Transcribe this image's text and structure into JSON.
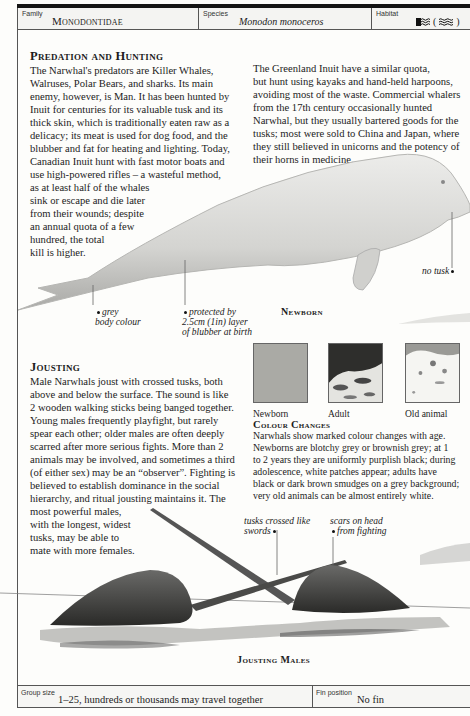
{
  "header": {
    "family_label": "Family",
    "family_value": "Monodontidae",
    "species_label": "Species",
    "species_value": "Monodon monoceros",
    "habitat_label": "Habitat",
    "habitat_icons": [
      "sea-ice-icon",
      "open-sea-icon"
    ],
    "habitat_paren_open": "(",
    "habitat_paren_close": ")"
  },
  "predation": {
    "title": "Predation and Hunting",
    "lines": [
      "The Narwhal's predators are Killer Whales,",
      "Walruses, Polar Bears, and sharks. Its main",
      "enemy, however, is Man. It has been hunted by",
      "Inuit for centuries for its valuable tusk and its",
      "thick skin, which is traditionally eaten raw as a",
      "delicacy; its meat is used for dog food, and the",
      "blubber and fat for heating and lighting. Today,",
      "Canadian Inuit hunt with fast motor boats and",
      "use high-powered rifles – a wasteful method,",
      "as at least half of the whales",
      "sink or escape and die later",
      "from their wounds; despite",
      "an annual quota of a few",
      "hundred, the total",
      "kill is higher."
    ]
  },
  "greenland": {
    "lines": [
      "The Greenland Inuit have a similar quota,",
      "but hunt using kayaks and hand-held harpoons,",
      "avoiding most of the waste. Commercial whalers",
      "from the 17th century occasionally hunted",
      "Narwhal, but they usually bartered goods for the",
      "tusks; most were sold to China and Japan, where",
      "they still believed in unicorns and the potency of",
      "their horns in medicine."
    ]
  },
  "newborn": {
    "title": "Newborn",
    "captions": {
      "grey": [
        "grey",
        "body colour"
      ],
      "blubber": [
        "protected by",
        "2.5cm (1in) layer",
        "of blubber at birth"
      ],
      "no_tusk": "no tusk"
    }
  },
  "jousting": {
    "title": "Jousting",
    "lines": [
      "Male Narwhals joust with crossed tusks, both",
      "above and below the surface. The sound is like",
      "2 wooden walking sticks being banged together.",
      "Young males frequently playfight, but rarely",
      "spear each other; older males are often deeply",
      "scarred after more serious fights. More than 2",
      "animals may be involved, and sometimes a third",
      "(of either sex) may be an “observer”. Fighting is",
      "believed to establish dominance in the social",
      "hierarchy, and ritual jousting maintains it. The",
      "most powerful males,",
      "with the longest, widest",
      "tusks, may be able to",
      "mate with more females."
    ],
    "captions": {
      "tusks": [
        "tusks crossed like",
        "swords"
      ],
      "scars": [
        "scars on head",
        "from fighting"
      ]
    },
    "art_title": "Jousting Males"
  },
  "colour_swatches": [
    {
      "label": "Newborn",
      "color": "#a9a9a4"
    },
    {
      "label": "Adult",
      "color": "#5a5a58"
    },
    {
      "label": "Old animal",
      "color": "#e6e6e2"
    }
  ],
  "colour_changes": {
    "title": "Colour Changes",
    "lines": [
      "Narwhals show marked colour changes with age.",
      "Newborns are blotchy grey or brownish grey; at 1",
      "to 2 years they are uniformly purplish black; during",
      "adolescence, white patches appear; adults have",
      "black or dark brown smudges on a grey background;",
      "very old animals can be almost entirely white."
    ]
  },
  "footer": {
    "group_label": "Group size",
    "group_value": "1–25, hundreds or thousands may travel together",
    "fin_label": "Fin position",
    "fin_value": "No fin"
  }
}
